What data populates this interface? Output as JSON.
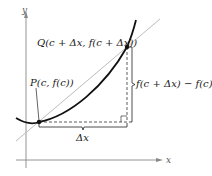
{
  "figure": {
    "axes": {
      "x_label": "x",
      "y_label": "y"
    },
    "points": {
      "P": {
        "label": "P(c, f(c))"
      },
      "Q": {
        "label": "Q(c + Δx, f(c + Δx))"
      }
    },
    "annotations": {
      "horizontal_change": "Δx",
      "vertical_change": "f(c + Δx) − f(c)"
    },
    "colors": {
      "curve": "#111111",
      "secant": "#bdbdbd",
      "axes": "#888888",
      "dashed": "#333333"
    }
  }
}
